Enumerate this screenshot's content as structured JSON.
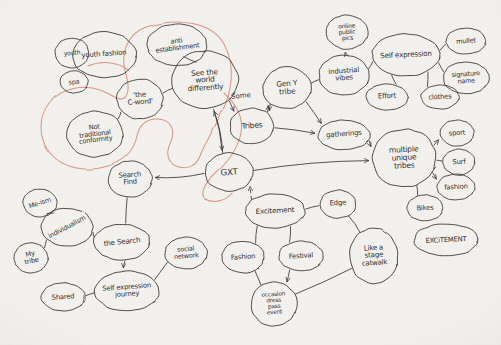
{
  "diagram": {
    "medium": "pen on paper photograph",
    "ink_color": "#3b3835",
    "highlight_color": "#d98f74",
    "paper_color": "#f2f1ee",
    "nodes": [
      {
        "id": "youth_fashion",
        "label": "youth fashion",
        "cx": 104,
        "cy": 55,
        "rx": 32,
        "ry": 23,
        "rot": -4,
        "font": 7.0
      },
      {
        "id": "small_left",
        "label": "youth",
        "cx": 72,
        "cy": 53,
        "rx": 17,
        "ry": 15,
        "rot": -6,
        "font": 6.2
      },
      {
        "id": "spa",
        "label": "spa",
        "cx": 74,
        "cy": 82,
        "rx": 14,
        "ry": 11,
        "rot": -5,
        "font": 6.4
      },
      {
        "id": "anti_establishment",
        "label": "anti\nestablishment",
        "cx": 177,
        "cy": 45,
        "rx": 30,
        "ry": 21,
        "rot": -7,
        "font": 6.6
      },
      {
        "id": "see_world",
        "label": "See the\nworld\ndifferently",
        "cx": 205,
        "cy": 80,
        "rx": 33,
        "ry": 29,
        "rot": -4,
        "font": 7.4
      },
      {
        "id": "the_c_word",
        "label": "'the\nC-word'",
        "cx": 140,
        "cy": 99,
        "rx": 23,
        "ry": 20,
        "rot": -4,
        "font": 7.0
      },
      {
        "id": "not_traditional",
        "label": "Not\ntraditional\nconformity",
        "cx": 95,
        "cy": 134,
        "rx": 28,
        "ry": 23,
        "rot": -7,
        "font": 6.6
      },
      {
        "id": "tribes",
        "label": "Tribes",
        "cx": 252,
        "cy": 126,
        "rx": 22,
        "ry": 18,
        "rot": -4,
        "font": 7.6
      },
      {
        "id": "gxt",
        "label": "GXT",
        "cx": 229,
        "cy": 172,
        "rx": 24,
        "ry": 19,
        "rot": -4,
        "font": 8.6
      },
      {
        "id": "gen_y_tribe",
        "label": "Gen Y\ntribe",
        "cx": 287,
        "cy": 88,
        "rx": 24,
        "ry": 21,
        "rot": -4,
        "font": 7.4
      },
      {
        "id": "industrial_vibes",
        "label": "industrial\nvibes",
        "cx": 344,
        "cy": 75,
        "rx": 25,
        "ry": 20,
        "rot": -4,
        "font": 7.0
      },
      {
        "id": "online_public_pics",
        "label": "online\npublic\npics",
        "cx": 347,
        "cy": 32,
        "rx": 21,
        "ry": 17,
        "rot": -4,
        "font": 6.0
      },
      {
        "id": "self_expression",
        "label": "Self expression",
        "cx": 406,
        "cy": 55,
        "rx": 34,
        "ry": 21,
        "rot": -3,
        "font": 7.2
      },
      {
        "id": "mullet",
        "label": "mullet",
        "cx": 466,
        "cy": 41,
        "rx": 20,
        "ry": 13,
        "rot": -4,
        "font": 6.6
      },
      {
        "id": "signature_name",
        "label": "signature\nname",
        "cx": 466,
        "cy": 78,
        "rx": 23,
        "ry": 16,
        "rot": -4,
        "font": 6.4
      },
      {
        "id": "effort",
        "label": "Effort",
        "cx": 387,
        "cy": 97,
        "rx": 21,
        "ry": 13,
        "rot": -3,
        "font": 7.0
      },
      {
        "id": "clothes",
        "label": "clothes",
        "cx": 440,
        "cy": 97,
        "rx": 19,
        "ry": 12,
        "rot": -3,
        "font": 6.8
      },
      {
        "id": "gatherings",
        "label": "gatherings",
        "cx": 344,
        "cy": 135,
        "rx": 26,
        "ry": 15,
        "rot": -4,
        "font": 7.0
      },
      {
        "id": "multiple_tribes",
        "label": "multiple\nunique\ntribes",
        "cx": 404,
        "cy": 158,
        "rx": 32,
        "ry": 29,
        "rot": -3,
        "font": 7.6
      },
      {
        "id": "sport",
        "label": "sport",
        "cx": 457,
        "cy": 133,
        "rx": 17,
        "ry": 13,
        "rot": -3,
        "font": 6.8
      },
      {
        "id": "surf",
        "label": "Surf",
        "cx": 459,
        "cy": 162,
        "rx": 16,
        "ry": 13,
        "rot": -3,
        "font": 6.8
      },
      {
        "id": "fashion_r",
        "label": "fashion",
        "cx": 456,
        "cy": 187,
        "rx": 19,
        "ry": 13,
        "rot": -3,
        "font": 6.8
      },
      {
        "id": "bikes",
        "label": "Bikes",
        "cx": 425,
        "cy": 208,
        "rx": 18,
        "ry": 13,
        "rot": -3,
        "font": 6.8
      },
      {
        "id": "excitement_r",
        "label": "EXCiTEMENT",
        "cx": 446,
        "cy": 240,
        "rx": 32,
        "ry": 16,
        "rot": -3,
        "font": 6.8
      },
      {
        "id": "search_find",
        "label": "Search\nFind",
        "cx": 130,
        "cy": 179,
        "rx": 22,
        "ry": 18,
        "rot": -4,
        "font": 7.0
      },
      {
        "id": "me_ism",
        "label": "Me-ism",
        "cx": 40,
        "cy": 203,
        "rx": 17,
        "ry": 14,
        "rot": -18,
        "font": 6.6
      },
      {
        "id": "individualism",
        "label": "individualism",
        "cx": 67,
        "cy": 227,
        "rx": 26,
        "ry": 19,
        "rot": -28,
        "font": 6.6
      },
      {
        "id": "my_tribe",
        "label": "My\ntribe",
        "cx": 31,
        "cy": 258,
        "rx": 17,
        "ry": 15,
        "rot": -12,
        "font": 6.6
      },
      {
        "id": "the_search",
        "label": "the Search",
        "cx": 122,
        "cy": 242,
        "rx": 28,
        "ry": 18,
        "rot": -6,
        "font": 7.2
      },
      {
        "id": "social_network",
        "label": "social\nnetwork",
        "cx": 186,
        "cy": 253,
        "rx": 21,
        "ry": 16,
        "rot": -5,
        "font": 6.4
      },
      {
        "id": "self_expr_journey",
        "label": "Self expression\njourney",
        "cx": 127,
        "cy": 291,
        "rx": 32,
        "ry": 20,
        "rot": -4,
        "font": 6.8
      },
      {
        "id": "shared",
        "label": "Shared",
        "cx": 63,
        "cy": 297,
        "rx": 22,
        "ry": 14,
        "rot": -4,
        "font": 6.8
      },
      {
        "id": "excitement_c",
        "label": "Excitement",
        "cx": 275,
        "cy": 211,
        "rx": 30,
        "ry": 17,
        "rot": -3,
        "font": 7.2
      },
      {
        "id": "edge",
        "label": "Edge",
        "cx": 338,
        "cy": 204,
        "rx": 18,
        "ry": 14,
        "rot": -3,
        "font": 7.0
      },
      {
        "id": "fashion_b",
        "label": "Fashion",
        "cx": 243,
        "cy": 257,
        "rx": 21,
        "ry": 16,
        "rot": -4,
        "font": 6.8
      },
      {
        "id": "festival",
        "label": "Festival",
        "cx": 301,
        "cy": 256,
        "rx": 22,
        "ry": 15,
        "rot": -4,
        "font": 6.8
      },
      {
        "id": "like_a_stage",
        "label": "Like a\nstage\ncatwalk",
        "cx": 374,
        "cy": 256,
        "rx": 24,
        "ry": 28,
        "rot": -4,
        "font": 7.0
      },
      {
        "id": "occasion",
        "label": "occasion\ndress\npass\nevent",
        "cx": 274,
        "cy": 304,
        "rx": 23,
        "ry": 22,
        "rot": -4,
        "font": 5.8
      }
    ],
    "edge_labels": [
      {
        "id": "some",
        "text": "Some",
        "x": 231,
        "y": 92,
        "rot": -6,
        "font": 7.0
      }
    ],
    "edges": [
      {
        "from": "the_c_word",
        "to": "not_traditional",
        "arrow": false
      },
      {
        "from": "the_c_word",
        "to": "see_world",
        "arrow": false
      },
      {
        "from": "anti_establishment",
        "to": "see_world",
        "arrow": false
      },
      {
        "from": "see_world",
        "to": "tribes",
        "arrow": true
      },
      {
        "from": "see_world",
        "to": "gxt",
        "arrow": true
      },
      {
        "from": "gxt",
        "to": "see_world",
        "arrow": true
      },
      {
        "from": "tribes",
        "to": "gen_y_tribe",
        "arrow": true
      },
      {
        "from": "gen_y_tribe",
        "to": "tribes",
        "arrow": true
      },
      {
        "from": "gen_y_tribe",
        "to": "industrial_vibes",
        "arrow": false
      },
      {
        "from": "industrial_vibes",
        "to": "online_public_pics",
        "arrow": true
      },
      {
        "from": "industrial_vibes",
        "to": "self_expression",
        "arrow": false
      },
      {
        "from": "self_expression",
        "to": "mullet",
        "arrow": false
      },
      {
        "from": "self_expression",
        "to": "signature_name",
        "arrow": false
      },
      {
        "from": "self_expression",
        "to": "effort",
        "arrow": false
      },
      {
        "from": "self_expression",
        "to": "clothes",
        "arrow": false
      },
      {
        "from": "tribes",
        "to": "gatherings",
        "arrow": true
      },
      {
        "from": "gen_y_tribe",
        "to": "gatherings",
        "arrow": true
      },
      {
        "from": "gatherings",
        "to": "multiple_tribes",
        "arrow": true
      },
      {
        "from": "multiple_tribes",
        "to": "sport",
        "arrow": true
      },
      {
        "from": "multiple_tribes",
        "to": "surf",
        "arrow": false
      },
      {
        "from": "multiple_tribes",
        "to": "fashion_r",
        "arrow": true
      },
      {
        "from": "multiple_tribes",
        "to": "bikes",
        "arrow": false
      },
      {
        "from": "gxt",
        "to": "multiple_tribes",
        "arrow": true
      },
      {
        "from": "gxt",
        "to": "search_find",
        "arrow": true
      },
      {
        "from": "search_find",
        "to": "the_search",
        "arrow": false
      },
      {
        "from": "me_ism",
        "to": "individualism",
        "arrow": false
      },
      {
        "from": "individualism",
        "to": "my_tribe",
        "arrow": false
      },
      {
        "from": "individualism",
        "to": "the_search",
        "arrow": false
      },
      {
        "from": "the_search",
        "to": "self_expr_journey",
        "arrow": true
      },
      {
        "from": "social_network",
        "to": "self_expr_journey",
        "arrow": false
      },
      {
        "from": "shared",
        "to": "self_expr_journey",
        "arrow": false
      },
      {
        "from": "excitement_c",
        "to": "edge",
        "arrow": false
      },
      {
        "from": "excitement_c",
        "to": "fashion_b",
        "arrow": false
      },
      {
        "from": "excitement_c",
        "to": "festival",
        "arrow": false
      },
      {
        "from": "fashion_b",
        "to": "occasion",
        "arrow": false
      },
      {
        "from": "festival",
        "to": "occasion",
        "arrow": true
      },
      {
        "from": "edge",
        "to": "like_a_stage",
        "arrow": false
      },
      {
        "from": "like_a_stage",
        "to": "occasion",
        "arrow": false
      }
    ],
    "dashed_edges": [
      {
        "id": "dash-gxt-excitement",
        "from": "excitement_c",
        "to": "gxt",
        "arrow": true
      }
    ],
    "highlight_paths": [
      {
        "id": "orange-loop",
        "note": "large orange loop enclosing the C-word / not-traditional cluster, sweeping right past GXT"
      },
      {
        "id": "orange-hook",
        "note": "orange hook sweeping from See-the-world down around GXT"
      }
    ]
  }
}
